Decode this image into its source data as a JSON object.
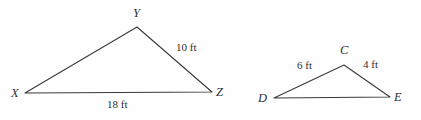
{
  "figure": {
    "type": "geometry-diagram",
    "background_color": "#fefefe",
    "stroke_color": "#3a3a3a",
    "text_color": "#2f2f2f",
    "units": "ft",
    "triangles": [
      {
        "name": "triangle-xyz",
        "vertices": [
          {
            "label": "X",
            "x": 25,
            "y": 93,
            "label_x": 11,
            "label_y": 87
          },
          {
            "label": "Y",
            "x": 137,
            "y": 27,
            "label_x": 133,
            "label_y": 7
          },
          {
            "label": "Z",
            "x": 212,
            "y": 92,
            "label_x": 216,
            "label_y": 86
          }
        ],
        "sides": [
          {
            "name": "side-yz",
            "label": "10 ft",
            "label_x": 176,
            "label_y": 42
          },
          {
            "name": "side-xz",
            "label": "18 ft",
            "label_x": 107,
            "label_y": 99
          },
          {
            "name": "side-xy",
            "label": "",
            "label_x": 0,
            "label_y": 0
          }
        ]
      },
      {
        "name": "triangle-cde",
        "vertices": [
          {
            "label": "D",
            "x": 274,
            "y": 98,
            "label_x": 258,
            "label_y": 92
          },
          {
            "label": "C",
            "x": 344,
            "y": 65,
            "label_x": 340,
            "label_y": 44
          },
          {
            "label": "E",
            "x": 390,
            "y": 97,
            "label_x": 394,
            "label_y": 91
          }
        ],
        "sides": [
          {
            "name": "side-dc",
            "label": "6 ft",
            "label_x": 297,
            "label_y": 60
          },
          {
            "name": "side-ce",
            "label": "4 ft",
            "label_x": 363,
            "label_y": 59
          },
          {
            "name": "side-de",
            "label": "",
            "label_x": 0,
            "label_y": 0
          }
        ]
      }
    ]
  },
  "chart_data": {
    "type": "diagram",
    "title": "",
    "shapes": [
      {
        "shape": "triangle",
        "id": "XYZ",
        "vertices": [
          "X",
          "Y",
          "Z"
        ],
        "side_lengths": {
          "YZ": 10,
          "XZ": 18,
          "XY": null
        },
        "units": "ft"
      },
      {
        "shape": "triangle",
        "id": "CDE",
        "vertices": [
          "D",
          "C",
          "E"
        ],
        "side_lengths": {
          "DC": 6,
          "CE": 4,
          "DE": null
        },
        "units": "ft"
      }
    ]
  }
}
